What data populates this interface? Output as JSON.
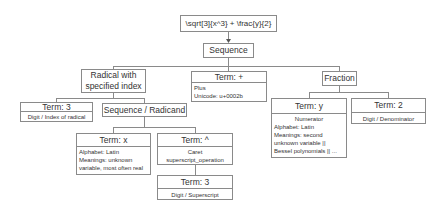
{
  "diagram": {
    "root": {
      "label": "\\sqrt[3]{x^3} + \\frac{y}{2}"
    },
    "sequence": {
      "label": "Sequence"
    },
    "radical": {
      "label_line1": "Radical with",
      "label_line2": "specified index"
    },
    "term_index": {
      "title": "Term: 3",
      "body": "Digit / Index of radical"
    },
    "seq_radicand": {
      "label": "Sequence / Radicand"
    },
    "term_x": {
      "title": "Term: x",
      "body": [
        "Alphabet: Latin",
        "Meanings: unknown",
        "variable, most often real"
      ]
    },
    "term_caret": {
      "title": "Term: ^",
      "body": [
        "Caret",
        "superscript_operation"
      ]
    },
    "term_sup3": {
      "title": "Term: 3",
      "body": "Digit / Superscript"
    },
    "term_plus": {
      "title": "Term: +",
      "body": [
        "Plus",
        "Unicode: u+0002b"
      ]
    },
    "fraction": {
      "label": "Fraction"
    },
    "term_y": {
      "title": "Term: y",
      "body_center": "Numerator",
      "body": [
        "Alphabet: Latin",
        "Meanings: second",
        "unknown variable ||",
        "Bessel polynomials || ..."
      ]
    },
    "term_denom": {
      "title": "Term: 2",
      "body": "Digit / Denominator"
    }
  },
  "colors": {
    "border": "#8a8a8a",
    "line": "#8a8a8a",
    "text": "#333333"
  }
}
